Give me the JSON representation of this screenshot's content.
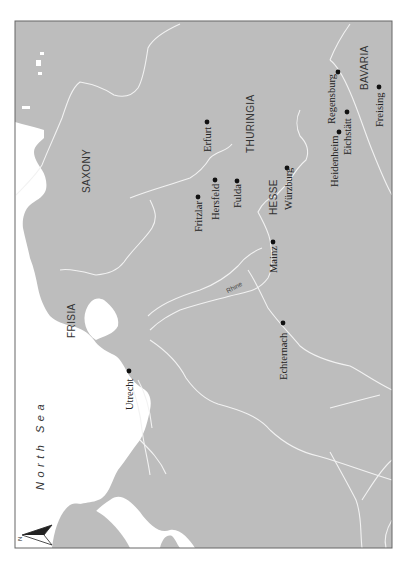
{
  "colors": {
    "land": "#bdbdbd",
    "sea": "#ffffff",
    "rivers": "#f2f2f2",
    "frame": "#666666",
    "dots": "#111111"
  },
  "orientation": "north-left",
  "compass": {
    "label": "N",
    "icon": "north-arrow-icon"
  },
  "water": {
    "north_sea": "North Sea"
  },
  "regions": {
    "saxony": "SAXONY",
    "thuringia": "THURINGIA",
    "hesse": "HESSE",
    "bavaria": "BAVARIA",
    "frisia": "FRISIA"
  },
  "rivers": {
    "rhine": "Rhine"
  },
  "cities": {
    "erfurt": "Erfurt",
    "fritzlar": "Fritzlar",
    "hersfeld": "Hersfeld",
    "fulda": "Fulda",
    "wurzburg": "Würzburg",
    "mainz": "Mainz",
    "regensburg": "Regensburg",
    "heidenheim": "Heidenheim",
    "eichstatt": "Eichstätt",
    "freising": "Freising",
    "echternach": "Echternach",
    "utrecht": "Utrecht"
  }
}
